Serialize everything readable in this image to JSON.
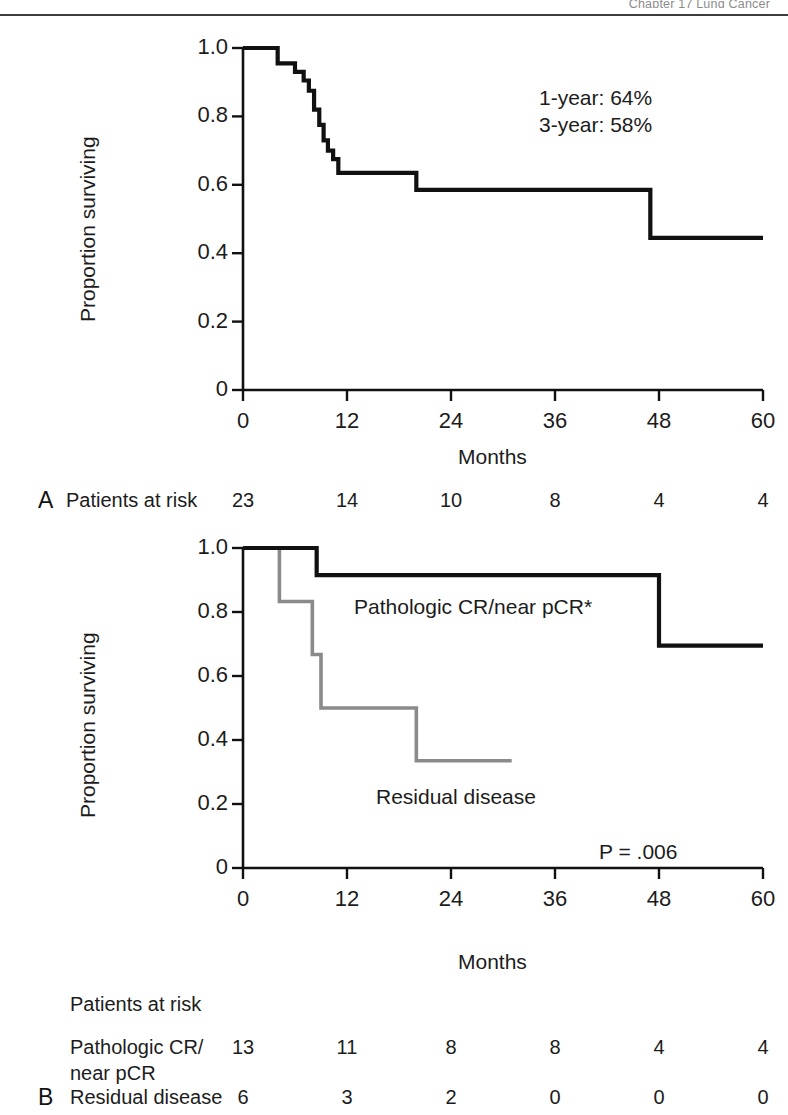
{
  "running_head": "Chapter 17   Lung Cancer",
  "figure": {
    "axis": {
      "y_label": "Proportion surviving",
      "y_ticks": [
        "1.0",
        "0.8",
        "0.6",
        "0.4",
        "0.2",
        "0"
      ],
      "y_values": [
        1.0,
        0.8,
        0.6,
        0.4,
        0.2,
        0.0
      ],
      "x_label": "Months",
      "x_ticks": [
        "0",
        "12",
        "24",
        "36",
        "48",
        "60"
      ],
      "x_values": [
        0,
        12,
        24,
        36,
        48,
        60
      ]
    },
    "panel_a": {
      "letter": "A",
      "annotation_line1": "1-year: 64%",
      "annotation_line2": "3-year: 58%",
      "risk_label": "Patients at risk",
      "risk_values": [
        "23",
        "14",
        "10",
        "8",
        "4",
        "4"
      ]
    },
    "panel_b": {
      "letter": "B",
      "label_curve_black": "Pathologic CR/near pCR*",
      "label_curve_gray": "Residual disease",
      "p_value": "P = .006",
      "risk_title": "Patients at risk",
      "risk_row1_label_line1": "Pathologic CR/",
      "risk_row1_label_line2": "near pCR",
      "risk_row1_values": [
        "13",
        "11",
        "8",
        "8",
        "4",
        "4"
      ],
      "risk_row2_label": "Residual disease",
      "risk_row2_values": [
        "6",
        "3",
        "2",
        "0",
        "0",
        "0"
      ]
    }
  },
  "colors": {
    "curve_black": "#111111",
    "curve_gray": "#8a8a8a",
    "axis": "#111111",
    "text": "#1c1c1c",
    "running_head": "#8c8c8c"
  },
  "chart_data": [
    {
      "type": "line",
      "id": "panel-a-overall-survival",
      "title": "",
      "subtitle": "Kaplan-Meier overall survival, all patients",
      "xlabel": "Months",
      "ylabel": "Proportion surviving",
      "xlim": [
        0,
        60
      ],
      "ylim": [
        0,
        1.0
      ],
      "grid": false,
      "legend": "none",
      "annotations": [
        "1-year: 64%",
        "3-year: 58%"
      ],
      "series": [
        {
          "name": "Overall survival",
          "style": "step",
          "color": "#111111",
          "x": [
            0,
            4,
            4,
            6,
            6,
            7,
            7,
            7.6,
            7.6,
            8.2,
            8.2,
            8.8,
            8.8,
            9.3,
            9.3,
            9.8,
            9.8,
            10.4,
            10.4,
            11,
            11,
            20,
            20,
            47,
            47,
            60
          ],
          "y": [
            1.0,
            1.0,
            0.955,
            0.955,
            0.93,
            0.93,
            0.905,
            0.905,
            0.875,
            0.875,
            0.82,
            0.82,
            0.775,
            0.775,
            0.73,
            0.73,
            0.7,
            0.7,
            0.675,
            0.675,
            0.635,
            0.635,
            0.585,
            0.585,
            0.445,
            0.445
          ]
        }
      ],
      "risk_table": {
        "row_label": "Patients at risk",
        "times": [
          0,
          12,
          24,
          36,
          48,
          60
        ],
        "values": [
          23,
          14,
          10,
          8,
          4,
          4
        ]
      }
    },
    {
      "type": "line",
      "id": "panel-b-survival-by-pathologic-response",
      "title": "",
      "subtitle": "Kaplan-Meier survival by pathologic response",
      "xlabel": "Months",
      "ylabel": "Proportion surviving",
      "xlim": [
        0,
        60
      ],
      "ylim": [
        0,
        1.0
      ],
      "grid": false,
      "legend": "inline-labels",
      "annotations": [
        "P = .006"
      ],
      "series": [
        {
          "name": "Pathologic CR/near pCR*",
          "style": "step",
          "color": "#111111",
          "x": [
            0,
            8.5,
            8.5,
            48,
            48,
            60
          ],
          "y": [
            1.0,
            1.0,
            0.915,
            0.915,
            0.695,
            0.695
          ]
        },
        {
          "name": "Residual disease",
          "style": "step",
          "color": "#8a8a8a",
          "x": [
            0,
            4.2,
            4.2,
            8.0,
            8.0,
            9.0,
            9.0,
            20,
            20,
            31
          ],
          "y": [
            1.0,
            1.0,
            0.833,
            0.833,
            0.667,
            0.667,
            0.5,
            0.5,
            0.335,
            0.335
          ]
        }
      ],
      "risk_table": {
        "title": "Patients at risk",
        "times": [
          0,
          12,
          24,
          36,
          48,
          60
        ],
        "rows": [
          {
            "label": "Pathologic CR/near pCR",
            "values": [
              13,
              11,
              8,
              8,
              4,
              4
            ]
          },
          {
            "label": "Residual disease",
            "values": [
              6,
              3,
              2,
              0,
              0,
              0
            ]
          }
        ]
      }
    }
  ]
}
